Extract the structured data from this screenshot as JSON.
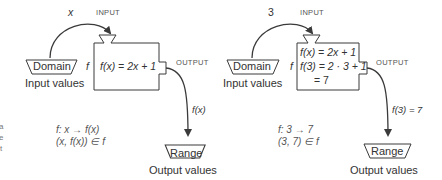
{
  "left_panel": {
    "arrow_in_label": "x",
    "input_label": "INPUT",
    "output_label": "OUTPUT",
    "function_name": "f",
    "domain_label": "Domain",
    "domain_caption": "Input values",
    "box_lines": [
      "f(x) = 2x + 1"
    ],
    "arrow_out_label": "f(x)",
    "range_label": "Range",
    "range_caption": "Output values",
    "mapping_line1": "f:   x → f(x)",
    "mapping_line2": "(x, f(x)) ∈ f"
  },
  "right_panel": {
    "arrow_in_label": "3",
    "input_label": "INPUT",
    "output_label": "OUTPUT",
    "function_name": "f",
    "domain_label": "Domain",
    "domain_caption": "Input values",
    "box_lines": [
      "f(x) = 2x + 1",
      "f(3) = 2 · 3 + 1",
      "= 7"
    ],
    "arrow_out_label": "f(3) = 7",
    "range_label": "Range",
    "range_caption": "Output values",
    "mapping_line1": "f:   3 → 7",
    "mapping_line2": "(3, 7) ∈ f"
  },
  "edge_fragments": [
    "a",
    "e",
    "t"
  ],
  "colors": {
    "stroke": "#3a3a3a",
    "text": "#333333",
    "background": "#ffffff"
  }
}
